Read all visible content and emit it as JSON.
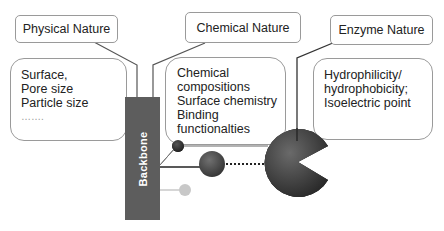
{
  "diagram": {
    "categories": [
      {
        "id": "physical",
        "title": "Physical Nature",
        "items": [
          "Surface,",
          "Pore size",
          "Particle size",
          "……."
        ]
      },
      {
        "id": "chemical",
        "title": "Chemical Nature",
        "items": [
          "Chemical",
          "compositions",
          "Surface chemistry",
          "Binding",
          "functionalties"
        ]
      },
      {
        "id": "enzyme",
        "title": "Enzyme Nature",
        "items": [
          "Hydrophilicity/",
          "hydrophobicity;",
          "Isoelectric point"
        ]
      }
    ],
    "backbone_label": "Backbone",
    "colors": {
      "backbone": "#5d5d5d",
      "enzyme": "#3a3a3a",
      "linker_small": "#2e2e2e",
      "linker_medium": "#444444",
      "inactive_linker": "#c8c8c8",
      "border": "#9a9a9a"
    }
  }
}
